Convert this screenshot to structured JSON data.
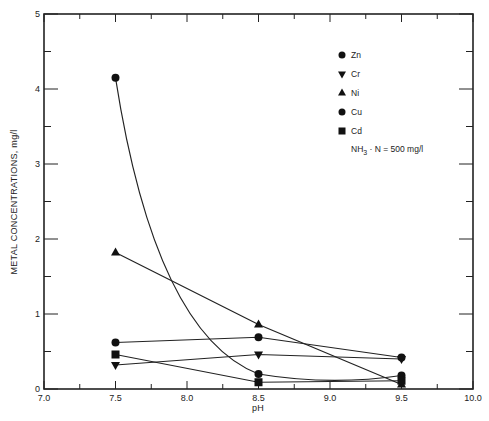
{
  "chart_data": {
    "type": "line",
    "title": "",
    "xlabel": "pH",
    "ylabel": "METAL CONCENTRATIONS, mg/l",
    "xlim": [
      7.0,
      10.0
    ],
    "ylim": [
      0,
      5
    ],
    "x_ticks": [
      "7.0",
      "7.5",
      "8.0",
      "8.5",
      "9.0",
      "9.5",
      "10.0"
    ],
    "y_ticks": [
      "0",
      "1",
      "2",
      "3",
      "4",
      "5"
    ],
    "grid": false,
    "legend_position": "upper right",
    "x": [
      7.5,
      8.5,
      9.5
    ],
    "series": [
      {
        "name": "Zn",
        "marker": "circle",
        "values": [
          4.15,
          0.2,
          0.18
        ],
        "curved": true
      },
      {
        "name": "Cr",
        "marker": "triangle-down",
        "values": [
          0.32,
          0.46,
          0.4
        ]
      },
      {
        "name": "Ni",
        "marker": "triangle-up",
        "values": [
          1.82,
          0.86,
          0.06
        ]
      },
      {
        "name": "Cu",
        "marker": "circle",
        "values": [
          0.62,
          0.69,
          0.42
        ]
      },
      {
        "name": "Cd",
        "marker": "square",
        "values": [
          0.46,
          0.09,
          0.11
        ]
      }
    ],
    "annotation": "NH3 · N = 500 mg/l"
  },
  "legend": {
    "items": [
      "Zn",
      "Cr",
      "Ni",
      "Cu",
      "Cd"
    ],
    "note_prefix": "NH",
    "note_sub": "3",
    "note_suffix": " · N = 500 mg/l"
  }
}
